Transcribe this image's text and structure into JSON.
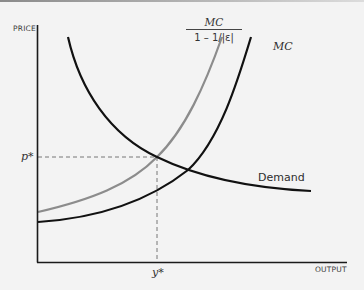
{
  "diagram": {
    "type": "economics-supply-demand",
    "axes": {
      "y_label": "PRICE",
      "x_label": "OUTPUT"
    },
    "curves": [
      {
        "id": "demand",
        "label": "Demand",
        "color": "#111111"
      },
      {
        "id": "mc",
        "label": "MC",
        "color": "#111111"
      },
      {
        "id": "markup-mc",
        "label_numerator": "MC",
        "label_denominator": "1 – 1/|ε|",
        "color": "#8c8c8c"
      }
    ],
    "equilibrium": {
      "price_label": "p*",
      "output_label": "y*"
    },
    "colors": {
      "background": "#f3f3f3",
      "axis": "#1a1a1a",
      "dashed_guides": "#666666"
    }
  }
}
